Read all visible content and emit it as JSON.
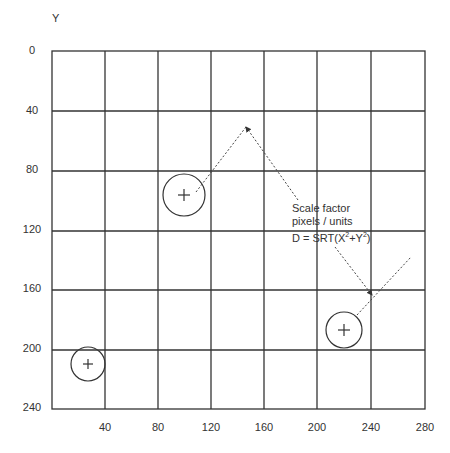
{
  "diagram": {
    "y_axis_title": "Y",
    "y_ticks": [
      "0",
      "40",
      "80",
      "120",
      "160",
      "200",
      "240"
    ],
    "x_ticks": [
      "40",
      "80",
      "120",
      "160",
      "200",
      "240",
      "280"
    ],
    "annotation": {
      "line1": "Scale factor",
      "line2": "pixels / units",
      "line3_prefix": "D = SRT(X",
      "sup1": "2",
      "plus": "+Y",
      "sup2": "2",
      "suffix": ")"
    },
    "markers": [
      {
        "name": "target-1",
        "x": 27,
        "y": 210,
        "symbol": "+"
      },
      {
        "name": "target-2",
        "x": 100,
        "y": 96,
        "symbol": "+"
      },
      {
        "name": "target-3",
        "x": 221,
        "y": 186,
        "symbol": "+"
      }
    ],
    "colors": {
      "grid": "#333333",
      "text": "#333333",
      "dotted": "#444444"
    }
  }
}
